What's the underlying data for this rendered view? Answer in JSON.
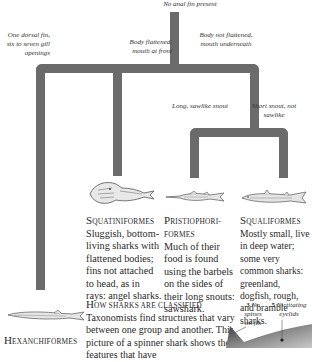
{
  "tree": {
    "root_label": "No anal fin present",
    "branches": {
      "hexanchi": "One dorsal fin, six to seven gill openings",
      "flattened": "Body flattened, mouth at front",
      "not_flattened": "Body not flattened, mouth underneath",
      "sawlike": "Long, sawlike snout",
      "not_sawlike": "Short snout, not sawlike"
    },
    "line_color": "#6b6b6b"
  },
  "orders": [
    {
      "cap": "S",
      "rest": "quatiniformes",
      "description": "Sluggish, bottom-living sharks with flattened bodies; fins not attached to head, as in rays: angel sharks."
    },
    {
      "cap": "P",
      "rest": "ristiophori-",
      "rest2": "formes",
      "description": "Much of their food is found using the barbels on the sides of their long snouts: sawshark."
    },
    {
      "cap": "S",
      "rest": "qualiformes",
      "description": "Mostly small, live in deep water; some very common sharks: greenland, dogfish, rough, and bramble sharks."
    },
    {
      "cap": "H",
      "rest": "exanchiformes"
    }
  ],
  "classification": {
    "heading_cap": "H",
    "heading_rest": "ow sharks are classified",
    "text": "Taxonomists find structures that vary between one group and another. This picture of a spinner shark shows the features that have"
  },
  "callouts": [
    {
      "number": "3",
      "label": "No spines on fin"
    },
    {
      "number": "5",
      "label": "Nictitating eyelids"
    }
  ]
}
